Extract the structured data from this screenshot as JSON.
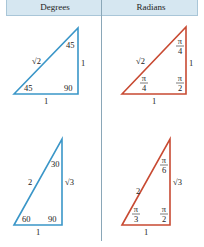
{
  "header": {
    "degrees_label": "Degrees",
    "radians_label": "Radians"
  },
  "colors": {
    "degrees_triangle": "#3a96c8",
    "radians_triangle": "#c84a32",
    "header_bg": "#d6e7f1"
  },
  "triangles": {
    "deg_45": {
      "top_angle": "45",
      "left_angle": "45",
      "right_angle": "90",
      "hypotenuse": "√2",
      "vertical_side": "1",
      "base": "1"
    },
    "rad_45": {
      "top_angle_num": "π",
      "top_angle_den": "4",
      "left_angle_num": "π",
      "left_angle_den": "4",
      "right_angle_num": "π",
      "right_angle_den": "2",
      "hypotenuse": "√2",
      "vertical_side": "1",
      "base": "1"
    },
    "deg_30_60": {
      "top_angle": "30",
      "left_angle": "60",
      "right_angle": "90",
      "hypotenuse": "2",
      "vertical_side": "√3",
      "base": "1"
    },
    "rad_30_60": {
      "top_angle_num": "π",
      "top_angle_den": "6",
      "left_angle_num": "π",
      "left_angle_den": "3",
      "right_angle_num": "π",
      "right_angle_den": "2",
      "hypotenuse": "2",
      "vertical_side": "√3",
      "base": "1"
    }
  }
}
